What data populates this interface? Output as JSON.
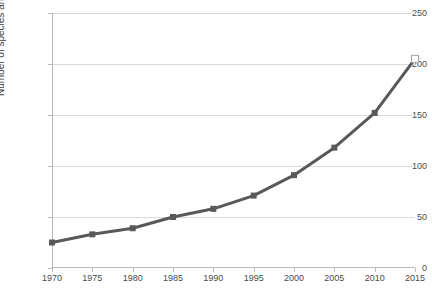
{
  "chart_data": {
    "type": "line",
    "title": "",
    "xlabel": "",
    "ylabel": "Number of species and subspecies",
    "categories": [
      "1970",
      "1975",
      "1980",
      "1985",
      "1990",
      "1995",
      "2000",
      "2005",
      "2010",
      "2015"
    ],
    "x": [
      1970,
      1975,
      1980,
      1985,
      1990,
      1995,
      2000,
      2005,
      2010,
      2015
    ],
    "values": [
      25,
      33,
      39,
      50,
      58,
      71,
      91,
      118,
      152,
      205
    ],
    "series": [
      {
        "name": "Number of species and subspecies",
        "values": [
          25,
          33,
          39,
          50,
          58,
          71,
          91,
          118,
          152,
          205
        ]
      }
    ],
    "xlim": [
      1970,
      2015
    ],
    "ylim": [
      0,
      250
    ],
    "yticks": [
      0,
      50,
      100,
      150,
      200,
      250
    ],
    "xticks": [
      1970,
      1975,
      1980,
      1985,
      1990,
      1995,
      2000,
      2005,
      2010,
      2015
    ],
    "grid": true,
    "legend": false,
    "line_color": "#595959",
    "marker_color": "#595959",
    "marker_shape": "square",
    "selected_point_index": 9,
    "selected_point_style": "hollow-white-square"
  },
  "axes": {
    "y_title": "Number of species and subspecies",
    "y_tick_labels": [
      "0",
      "50",
      "100",
      "150",
      "200",
      "250"
    ],
    "x_tick_labels": [
      "1970",
      "1975",
      "1980",
      "1985",
      "1990",
      "1995",
      "2000",
      "2005",
      "2010",
      "2015"
    ]
  },
  "colors": {
    "line": "#595959",
    "grid": "#dadada",
    "axis": "#b8b8b8",
    "text": "#4a4a4a",
    "background": "#ffffff"
  }
}
